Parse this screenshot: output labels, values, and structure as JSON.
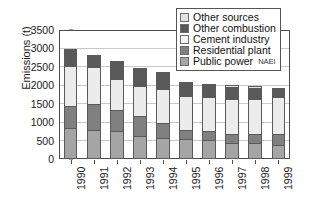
{
  "chart_data": {
    "type": "bar",
    "subtype": "stacked-bar",
    "title": "",
    "xlabel": "",
    "ylabel": "Emissions (t)",
    "ylim": [
      0,
      3500
    ],
    "ytick_step": 500,
    "yticks": [
      0,
      500,
      1000,
      1500,
      2000,
      2500,
      3000,
      3500
    ],
    "grid": true,
    "grid_axis": "y",
    "legend_position": "top-right",
    "categories": [
      "1990",
      "1991",
      "1992",
      "1993",
      "1994",
      "1995",
      "1996",
      "1997",
      "1998",
      "1999"
    ],
    "series": [
      {
        "name": "Public power",
        "color": "#a5a5a5",
        "values": [
          830,
          800,
          760,
          620,
          580,
          550,
          520,
          440,
          430,
          370
        ]
      },
      {
        "name": "Residential plant",
        "color": "#808080",
        "values": [
          620,
          700,
          600,
          570,
          410,
          260,
          260,
          270,
          270,
          340
        ]
      },
      {
        "name": "Cement industry",
        "color": "#ececec",
        "values": [
          1110,
          1030,
          840,
          830,
          950,
          940,
          930,
          950,
          960,
          1000
        ]
      },
      {
        "name": "Other combustion",
        "color": "#595959",
        "values": [
          470,
          340,
          490,
          490,
          460,
          370,
          350,
          350,
          330,
          260
        ]
      },
      {
        "name": "Other sources",
        "color": "#e2e2e2",
        "values": [
          40,
          40,
          40,
          40,
          40,
          40,
          40,
          70,
          70,
          30
        ]
      }
    ],
    "totals": [
      3070,
      2910,
      2730,
      2550,
      2440,
      2160,
      2100,
      2080,
      2060,
      2000
    ],
    "annotations": [
      "NAEI"
    ]
  },
  "legend": {
    "items": [
      {
        "label": "Other sources",
        "color": "#e2e2e2"
      },
      {
        "label": "Other combustion",
        "color": "#595959"
      },
      {
        "label": "Cement industry",
        "color": "#f4f4f4"
      },
      {
        "label": "Residential plant",
        "color": "#808080"
      },
      {
        "label": "Public power",
        "color": "#a5a5a5"
      }
    ],
    "watermark": "NAEI"
  },
  "axes": {
    "y": {
      "title": "Emissions (t)",
      "ticks": [
        "0",
        "500",
        "1000",
        "1500",
        "2000",
        "2500",
        "3000",
        "3500"
      ]
    },
    "x": {
      "ticks": [
        "1990",
        "1991",
        "1992",
        "1993",
        "1994",
        "1995",
        "1996",
        "1997",
        "1998",
        "1999"
      ]
    }
  }
}
